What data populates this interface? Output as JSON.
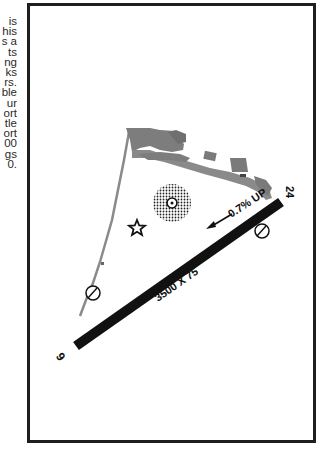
{
  "side_text": {
    "lines": [
      "is",
      "his",
      "s a",
      "ts",
      "ng",
      "ks",
      "rs.",
      "ble",
      "ur",
      "ort",
      "tle",
      "ort",
      "00",
      "gs",
      "0."
    ]
  },
  "diagram": {
    "runway": {
      "dimensions_label": "3500 X 75",
      "end_a": "6",
      "end_b": "24",
      "gradient_label": "0.7% UP",
      "color": "#111111"
    },
    "symbols": {
      "beacon": "star-icon",
      "segmented_circle": "segmented-circle-icon",
      "runway_end_markers": [
        "circle-marker-icon",
        "circle-marker-icon"
      ]
    },
    "colors": {
      "apron": "#7d7d7d",
      "taxiway": "#8a8a8a",
      "frame": "#1e1e1e"
    }
  }
}
